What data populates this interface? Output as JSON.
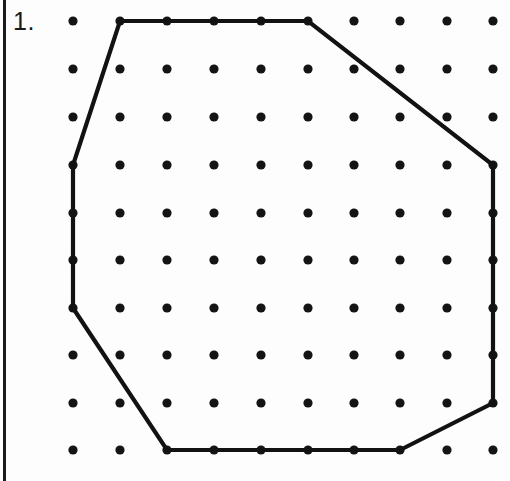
{
  "page": {
    "width": 510,
    "height": 481,
    "background_color": "#fdfdfd",
    "border_color": "#1a1a1a"
  },
  "label": {
    "problem_number": "1."
  },
  "chart_data": {
    "type": "scatter",
    "title": "",
    "subtitle": "",
    "xlabel": "",
    "ylabel": "",
    "grid": false,
    "legend": false,
    "dot_color": "#141414",
    "dot_radius": 4.6,
    "stroke_color": "#121212",
    "stroke_width": 4.2,
    "grid_dots": {
      "rows": 10,
      "cols": 10,
      "x_start": 73,
      "y_start": 21,
      "x_spacing": 46.7,
      "y_spacing": 47.7,
      "x_positions": [
        73,
        120,
        167,
        214,
        261,
        308,
        354,
        400,
        447,
        493
      ],
      "y_positions": [
        21,
        69,
        117,
        165,
        213,
        260,
        308,
        355,
        403,
        450
      ]
    },
    "polygon": {
      "name": "octagon",
      "closed": true,
      "vertex_count": 8,
      "vertices_px": [
        [
          120,
          21
        ],
        [
          308,
          21
        ],
        [
          493,
          165
        ],
        [
          493,
          403
        ],
        [
          400,
          450
        ],
        [
          167,
          450
        ],
        [
          73,
          308
        ],
        [
          73,
          165
        ]
      ],
      "vertices_grid": [
        [
          1,
          0
        ],
        [
          5,
          0
        ],
        [
          9,
          3
        ],
        [
          9,
          8
        ],
        [
          7,
          9
        ],
        [
          2,
          9
        ],
        [
          0,
          6
        ],
        [
          0,
          3
        ]
      ],
      "edges": [
        {
          "from": [
            1,
            0
          ],
          "to": [
            5,
            0
          ],
          "kind": "horizontal-top"
        },
        {
          "from": [
            5,
            0
          ],
          "to": [
            9,
            3
          ],
          "kind": "diagonal-upper-right"
        },
        {
          "from": [
            9,
            3
          ],
          "to": [
            9,
            8
          ],
          "kind": "vertical-right"
        },
        {
          "from": [
            9,
            8
          ],
          "to": [
            7,
            9
          ],
          "kind": "diagonal-lower-right"
        },
        {
          "from": [
            7,
            9
          ],
          "to": [
            2,
            9
          ],
          "kind": "horizontal-bottom"
        },
        {
          "from": [
            2,
            9
          ],
          "to": [
            0,
            6
          ],
          "kind": "diagonal-lower-left"
        },
        {
          "from": [
            0,
            6
          ],
          "to": [
            0,
            3
          ],
          "kind": "vertical-left"
        },
        {
          "from": [
            0,
            3
          ],
          "to": [
            1,
            0
          ],
          "kind": "diagonal-upper-left"
        }
      ]
    }
  }
}
